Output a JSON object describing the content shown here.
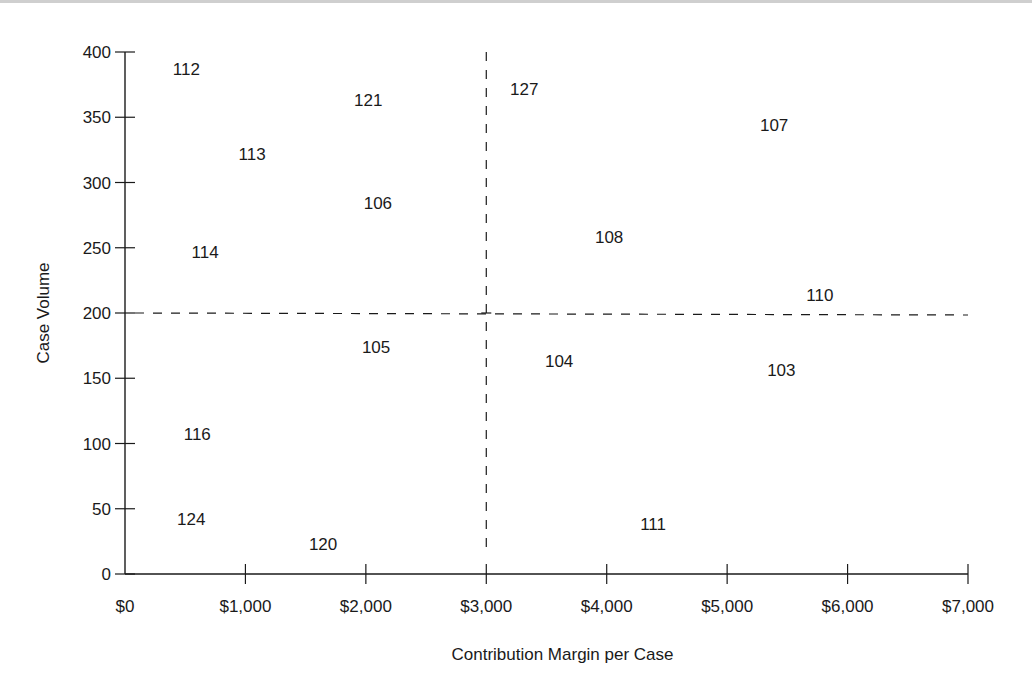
{
  "chart_data": {
    "type": "scatter",
    "title": "",
    "xlabel": "Contribution Margin per Case",
    "ylabel": "Case Volume",
    "xlim": [
      0,
      7000
    ],
    "ylim": [
      0,
      400
    ],
    "grid": false,
    "legend": null,
    "x_ticks": [
      0,
      1000,
      2000,
      3000,
      4000,
      5000,
      6000,
      7000
    ],
    "x_tick_labels": [
      "$0",
      "$1,000",
      "$2,000",
      "$3,000",
      "$4,000",
      "$5,000",
      "$6,000",
      "$7,000"
    ],
    "y_ticks": [
      0,
      50,
      100,
      150,
      200,
      250,
      300,
      350,
      400
    ],
    "y_tick_labels": [
      "0",
      "50",
      "100",
      "150",
      "200",
      "250",
      "300",
      "350",
      "400"
    ],
    "reference_lines": [
      {
        "orientation": "vertical",
        "value": 3000,
        "style": "dashed"
      },
      {
        "orientation": "horizontal",
        "value": 200,
        "style": "dashed"
      }
    ],
    "marker": "text-label",
    "points": [
      {
        "label": "112",
        "x": 510,
        "y": 387
      },
      {
        "label": "121",
        "x": 2020,
        "y": 363
      },
      {
        "label": "127",
        "x": 3315,
        "y": 372
      },
      {
        "label": "107",
        "x": 5390,
        "y": 344
      },
      {
        "label": "113",
        "x": 1055,
        "y": 322
      },
      {
        "label": "106",
        "x": 2100,
        "y": 284
      },
      {
        "label": "108",
        "x": 4020,
        "y": 258
      },
      {
        "label": "114",
        "x": 665,
        "y": 247
      },
      {
        "label": "110",
        "x": 5770,
        "y": 214
      },
      {
        "label": "105",
        "x": 2085,
        "y": 174
      },
      {
        "label": "104",
        "x": 3605,
        "y": 163
      },
      {
        "label": "103",
        "x": 5450,
        "y": 156
      },
      {
        "label": "116",
        "x": 600,
        "y": 107
      },
      {
        "label": "124",
        "x": 550,
        "y": 42
      },
      {
        "label": "111",
        "x": 4385,
        "y": 38
      },
      {
        "label": "120",
        "x": 1645,
        "y": 23
      }
    ]
  },
  "colors": {
    "ink": "#1a1a1a",
    "background": "#ffffff"
  }
}
